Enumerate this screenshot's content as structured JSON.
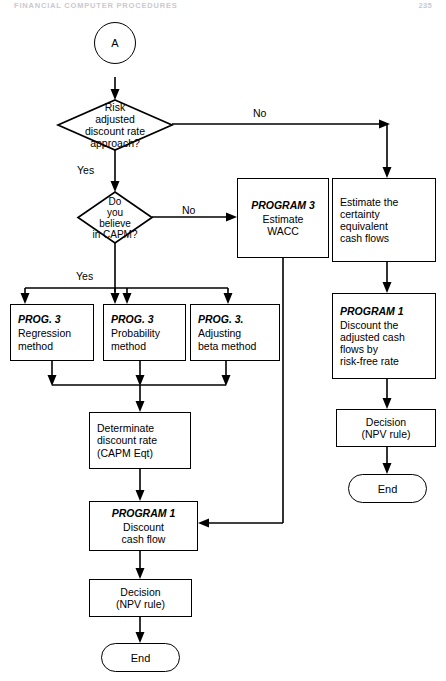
{
  "page": {
    "header_title": "FINANCIAL COMPUTER PROCEDURES",
    "page_number": "235"
  },
  "diagram": {
    "nodes": {
      "connector_a": {
        "label": "A",
        "shape": "circle"
      },
      "decision_radr": {
        "shape": "diamond",
        "lines": [
          "Risk",
          "adjusted",
          "discount rate",
          "approach?"
        ]
      },
      "decision_capm": {
        "shape": "diamond",
        "lines": [
          "Do",
          "you",
          "believe",
          "in CAPM?"
        ]
      },
      "program3_wacc": {
        "shape": "process",
        "program": "PROGRAM 3",
        "lines": [
          "Estimate",
          "WACC"
        ]
      },
      "estimate_ce": {
        "shape": "process",
        "program": "",
        "lines": [
          "Estimate the",
          "certainty",
          "equivalent",
          "cash flows"
        ]
      },
      "prog3_regression": {
        "shape": "process",
        "program": "PROG. 3",
        "lines": [
          "Regression",
          "method"
        ]
      },
      "prog3_probability": {
        "shape": "process",
        "program": "PROG. 3",
        "lines": [
          "Probability",
          "method"
        ]
      },
      "prog3_beta": {
        "shape": "process",
        "program": "PROG. 3.",
        "lines": [
          "Adjusting",
          "beta method"
        ]
      },
      "determinate_rate": {
        "shape": "process",
        "program": "",
        "lines": [
          "Determinate",
          "discount rate",
          "(CAPM Eqt)"
        ]
      },
      "program1_discount": {
        "shape": "process",
        "program": "PROGRAM 1",
        "lines": [
          "Discount",
          "cash flow"
        ]
      },
      "program1_riskfree": {
        "shape": "process",
        "program": "PROGRAM 1",
        "lines": [
          "Discount the",
          "adjusted cash",
          "flows by",
          "risk-free rate"
        ]
      },
      "decision_npv_left": {
        "shape": "process",
        "program": "",
        "lines": [
          "Decision",
          "(NPV rule)"
        ]
      },
      "decision_npv_right": {
        "shape": "process",
        "program": "",
        "lines": [
          "Decision",
          "(NPV rule)"
        ]
      },
      "end_left": {
        "label": "End",
        "shape": "terminator"
      },
      "end_right": {
        "label": "End",
        "shape": "terminator"
      }
    },
    "edge_labels": {
      "radr_no": "No",
      "radr_yes": "Yes",
      "capm_no": "No",
      "capm_yes": "Yes"
    }
  }
}
